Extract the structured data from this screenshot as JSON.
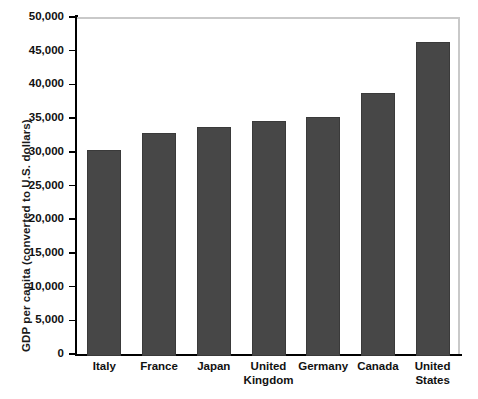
{
  "chart_data": {
    "type": "bar",
    "title": "",
    "subtitle": "",
    "xlabel": "",
    "ylabel": "GDP per capita (converted to U.S. dollars)",
    "categories": [
      "Italy",
      "France",
      "Japan",
      "United Kingdom",
      "Germany",
      "Canada",
      "United States"
    ],
    "category_lines": [
      [
        "Italy"
      ],
      [
        "France"
      ],
      [
        "Japan"
      ],
      [
        "United",
        "Kingdom"
      ],
      [
        "Germany"
      ],
      [
        "Canada"
      ],
      [
        "United",
        "States"
      ]
    ],
    "values": [
      30600,
      33100,
      34000,
      34800,
      35400,
      39000,
      46600
    ],
    "ylim": [
      0,
      50000
    ],
    "ytick_values": [
      0,
      5000,
      10000,
      15000,
      20000,
      25000,
      30000,
      35000,
      40000,
      45000,
      50000
    ],
    "ytick_labels": [
      "0",
      "5,000",
      "10,000",
      "15,000",
      "20,000",
      "25,000",
      "30,000",
      "35,000",
      "40,000",
      "45,000",
      "50,000"
    ],
    "grid": false,
    "legend": null,
    "legend_position": "none",
    "bar_color": "#474747",
    "bar_edge_color": "#3a3a3a",
    "axis_color": "#000000",
    "frame_color": "#c9c9c9",
    "background_color": "#ffffff"
  }
}
